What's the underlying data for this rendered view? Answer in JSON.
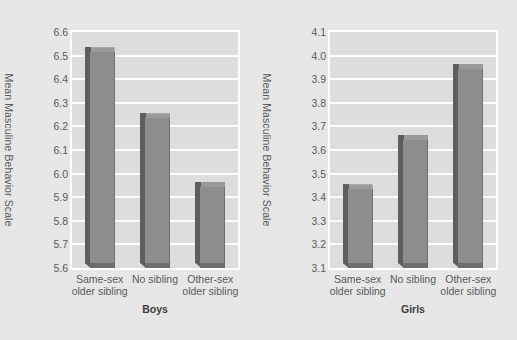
{
  "figure": {
    "background_color": "#e8e8e8",
    "plot_background_color": "#dedede",
    "gridline_color": "#ffffff",
    "bar_face_color": "#8e8e8e",
    "bar_side_color": "#5e5e5e",
    "text_color": "#5a5a5a"
  },
  "chart_data": [
    {
      "type": "bar",
      "title": "Boys",
      "xlabel": "",
      "ylabel": "Mean Masculine Behavior Scale",
      "ylim": [
        5.6,
        6.6
      ],
      "ytick_labels": [
        "6.6",
        "6.5",
        "6.4",
        "6.3",
        "6.2",
        "6.1",
        "6.0",
        "5.9",
        "5.8",
        "5.7",
        "5.6"
      ],
      "ytick_values": [
        6.6,
        6.5,
        6.4,
        6.3,
        6.2,
        6.1,
        6.0,
        5.9,
        5.8,
        5.7,
        5.6
      ],
      "grid": true,
      "legend": "none",
      "categories": [
        "Same-sex older sibling",
        "No sibling",
        "Other-sex older sibling"
      ],
      "category_lines": [
        [
          "Same-sex",
          "older sibling"
        ],
        [
          "No sibling",
          ""
        ],
        [
          "Other-sex",
          "older sibling"
        ]
      ],
      "values": [
        6.51,
        6.23,
        5.94
      ]
    },
    {
      "type": "bar",
      "title": "Girls",
      "xlabel": "",
      "ylabel": "Mean Masculine Behavior Scale",
      "ylim": [
        3.1,
        4.1
      ],
      "ytick_labels": [
        "4.1",
        "4.0",
        "3.9",
        "3.8",
        "3.7",
        "3.6",
        "3.5",
        "3.4",
        "3.3",
        "3.2",
        "3.1"
      ],
      "ytick_values": [
        4.1,
        4.0,
        3.9,
        3.8,
        3.7,
        3.6,
        3.5,
        3.4,
        3.3,
        3.2,
        3.1
      ],
      "grid": true,
      "legend": "none",
      "categories": [
        "Same-sex older sibling",
        "No sibling",
        "Other-sex older sibling"
      ],
      "category_lines": [
        [
          "Same-sex",
          "older sibling"
        ],
        [
          "No sibling",
          ""
        ],
        [
          "Other-sex",
          "older sibling"
        ]
      ],
      "values": [
        3.43,
        3.64,
        3.94
      ]
    }
  ]
}
